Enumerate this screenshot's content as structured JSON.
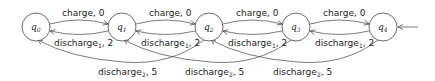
{
  "diagram": {
    "type": "state-machine",
    "states": [
      {
        "id": "q0",
        "label": "q",
        "sub": "0",
        "cx": 36,
        "cy": 27
      },
      {
        "id": "q1",
        "label": "q",
        "sub": "1",
        "cx": 122,
        "cy": 27
      },
      {
        "id": "q2",
        "label": "q",
        "sub": "2",
        "cx": 209,
        "cy": 27
      },
      {
        "id": "q3",
        "label": "q",
        "sub": "3",
        "cx": 296,
        "cy": 27
      },
      {
        "id": "q4",
        "label": "q",
        "sub": "4",
        "cx": 383,
        "cy": 27
      }
    ],
    "initial_state": "q4",
    "transitions": [
      {
        "from": "q0",
        "to": "q1",
        "action": "charge",
        "sub": "",
        "cost": "0"
      },
      {
        "from": "q1",
        "to": "q2",
        "action": "charge",
        "sub": "",
        "cost": "0"
      },
      {
        "from": "q2",
        "to": "q3",
        "action": "charge",
        "sub": "",
        "cost": "0"
      },
      {
        "from": "q3",
        "to": "q4",
        "action": "charge",
        "sub": "",
        "cost": "0"
      },
      {
        "from": "q1",
        "to": "q0",
        "action": "discharge",
        "sub": "1",
        "cost": "2"
      },
      {
        "from": "q2",
        "to": "q1",
        "action": "discharge",
        "sub": "1",
        "cost": "2"
      },
      {
        "from": "q3",
        "to": "q2",
        "action": "discharge",
        "sub": "1",
        "cost": "2"
      },
      {
        "from": "q4",
        "to": "q3",
        "action": "discharge",
        "sub": "1",
        "cost": "2"
      },
      {
        "from": "q2",
        "to": "q0",
        "action": "discharge",
        "sub": "2",
        "cost": "5"
      },
      {
        "from": "q3",
        "to": "q1",
        "action": "discharge",
        "sub": "2",
        "cost": "5"
      },
      {
        "from": "q4",
        "to": "q2",
        "action": "discharge",
        "sub": "2",
        "cost": "5"
      }
    ],
    "labels": {
      "charge": "charge, 0",
      "discharge1_action": "discharge",
      "discharge1_sub": "1",
      "discharge1_cost": ", 2",
      "discharge2_action": "discharge",
      "discharge2_sub": "2",
      "discharge2_cost": ", 5"
    }
  }
}
